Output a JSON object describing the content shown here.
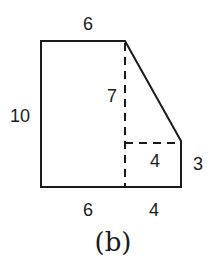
{
  "figure": {
    "caption": "(b)",
    "labels": {
      "top": "6",
      "left": "10",
      "inner_vertical": "7",
      "inner_horizontal": "4",
      "right": "3",
      "bottom_left": "6",
      "bottom_right": "4"
    },
    "colors": {
      "stroke": "#1a1a1a",
      "background": "#ffffff"
    }
  }
}
